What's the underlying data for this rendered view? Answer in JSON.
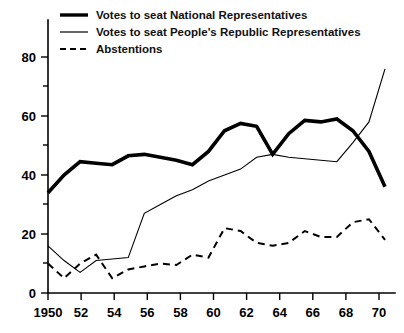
{
  "chart_data": {
    "type": "line",
    "title": "",
    "xlabel": "",
    "ylabel": "",
    "xlim": [
      1950,
      1971
    ],
    "ylim": [
      0,
      85
    ],
    "grid": false,
    "legend_position": "top-left",
    "y_ticks": [
      0,
      20,
      40,
      60,
      80
    ],
    "y_minor_ticks": [
      10,
      30,
      50,
      70
    ],
    "y_tick_labels": [
      "0",
      "20",
      "40",
      "60",
      "80"
    ],
    "x_ticks": [
      1950,
      1952,
      1954,
      1956,
      1958,
      1960,
      1962,
      1964,
      1966,
      1968,
      1970
    ],
    "x_tick_labels": [
      "1950",
      "52",
      "54",
      "56",
      "58",
      "60",
      "62",
      "64",
      "66",
      "68",
      "70"
    ],
    "x": [
      1950,
      1951,
      1952,
      1953,
      1954,
      1955,
      1956,
      1957,
      1958,
      1959,
      1960,
      1961,
      1962,
      1963,
      1964,
      1965,
      1966,
      1967,
      1968,
      1969,
      1970,
      1971
    ],
    "series": [
      {
        "name": "Votes to seat National Representatives",
        "style": "thick-solid",
        "values": [
          34,
          40,
          44.5,
          44,
          43.5,
          46.5,
          47,
          46,
          45,
          43.5,
          48,
          55,
          57.5,
          56.5,
          47,
          54,
          58.5,
          58,
          59,
          55,
          48,
          36
        ]
      },
      {
        "name": "Votes to seat People's Republic Representatives",
        "style": "thin-solid",
        "values": [
          16,
          11,
          7,
          11,
          11.5,
          12,
          27,
          30,
          33,
          35,
          38,
          40,
          42,
          46,
          47,
          46,
          45.5,
          45,
          44.5,
          51,
          58,
          76
        ]
      },
      {
        "name": "Abstentions",
        "style": "dashed",
        "values": [
          10,
          5,
          10,
          13,
          5,
          8,
          9,
          10,
          9.5,
          13,
          12,
          22,
          21,
          17,
          16,
          17,
          21,
          19,
          19,
          24,
          25,
          18
        ]
      }
    ]
  },
  "legend": {
    "items": [
      {
        "label": "Votes to seat National Representatives",
        "style": "thick-solid"
      },
      {
        "label": "Votes to seat People's Republic Representatives",
        "style": "thin-solid"
      },
      {
        "label": "Abstentions",
        "style": "dashed"
      }
    ]
  }
}
